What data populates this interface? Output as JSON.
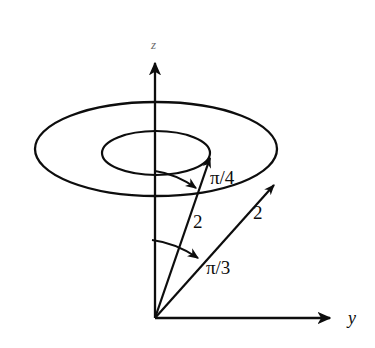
{
  "figure": {
    "kind": "math-diagram",
    "background_color": "#ffffff",
    "ink_color": "#0d0d0d"
  },
  "axes": {
    "z": {
      "label": "z",
      "name": "z-axis",
      "arrow": "up"
    },
    "y": {
      "label": "y",
      "name": "y-axis",
      "arrow": "right"
    }
  },
  "angles": [
    {
      "id": "phi-upper",
      "label": "π/4",
      "measured_from": "z-axis",
      "value_radians": 0.7853981634
    },
    {
      "id": "phi-lower",
      "label": "π/3",
      "measured_from": "z-axis",
      "value_radians": 1.0471975512
    }
  ],
  "radii": [
    {
      "id": "rho-inner",
      "label": "2",
      "belongs_to": "π/4 ray"
    },
    {
      "id": "rho-outer",
      "label": "2",
      "belongs_to": "π/3 ray"
    }
  ],
  "rings": [
    {
      "id": "outer-ring",
      "name": "outer-cone-ring",
      "center_x": 156,
      "center_y": 149,
      "rx": 121,
      "ry": 47
    },
    {
      "id": "inner-ring",
      "name": "inner-cone-ring",
      "center_x": 156,
      "center_y": 153,
      "rx": 54,
      "ry": 22
    }
  ],
  "origin": {
    "x": 155,
    "y": 318
  }
}
